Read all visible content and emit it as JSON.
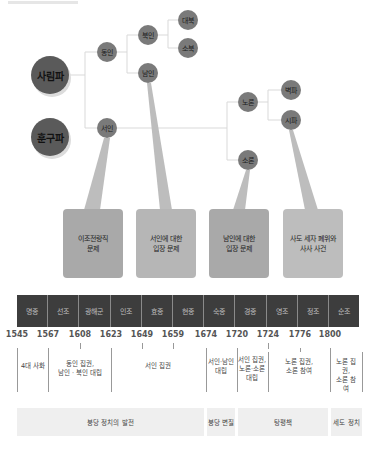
{
  "factions": {
    "sarim": "사림파",
    "hungu": "훈구파",
    "dongin": "동인",
    "seoin": "서인",
    "bukin": "북인",
    "namin": "남인",
    "daebuk": "대북",
    "sobuk": "소북",
    "noron": "노론",
    "soron": "소론",
    "byeokpa": "벽파",
    "sipa": "시파"
  },
  "callouts": [
    "이조전랑직\n문제",
    "서인에 대한\n입장 문제",
    "남인에 대한\n입장 문제",
    "사도 세자 폐위와\n사사 사건"
  ],
  "reigns": [
    "명종",
    "선조",
    "광해군",
    "인조",
    "효종",
    "현종",
    "숙종",
    "경종",
    "영조",
    "정조",
    "순조"
  ],
  "years": [
    "1545",
    "1567",
    "1608",
    "1623",
    "1649",
    "1659",
    "1674",
    "1720",
    "1724",
    "1776",
    "1800"
  ],
  "era_notes": [
    "4대 사화",
    "동인 집권,\n남인 · 북인 대립",
    "서인 집권",
    "서인·남인\n대립",
    "서인 집권,\n노론·소론\n대립",
    "노론 집권,\n소론 참여",
    "노론 집권,\n소론 참여"
  ],
  "phases": [
    "붕당 정치의 발전",
    "붕당 변질",
    "탕평책",
    "세도 정치"
  ],
  "colors": {
    "big_node": "#5a5a5a",
    "small_node": "#7a7a7a",
    "reign_bar": "#3d3d3d",
    "phase_bg": "#efefef"
  }
}
